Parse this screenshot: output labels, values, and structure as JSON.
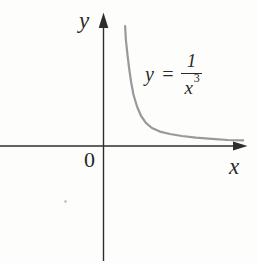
{
  "figure": {
    "background_color": "#fdfdfb",
    "axis_color": "#2e2e2e",
    "text_color": "#2a2a2a",
    "curve_color": "#98999b",
    "labels": {
      "y_axis": "y",
      "x_axis": "x",
      "origin": "0"
    },
    "equation": {
      "lhs": "y",
      "equals": "=",
      "numerator": "1",
      "denominator_base": "x",
      "denominator_exponent": "3"
    }
  },
  "chart_data": {
    "type": "line",
    "title": "",
    "equation": "y = 1/x^3",
    "xlabel": "x",
    "ylabel": "y",
    "origin_label": "0",
    "x": [
      0.54,
      0.56,
      0.6,
      0.64,
      0.69,
      0.75,
      0.84,
      0.94,
      1.06,
      1.21,
      1.41,
      1.66,
      1.96,
      2.31,
      2.71,
      3.11,
      3.49
    ],
    "y": [
      3.0,
      2.65,
      2.28,
      1.95,
      1.6,
      1.28,
      0.98,
      0.75,
      0.58,
      0.45,
      0.36,
      0.3,
      0.25,
      0.21,
      0.18,
      0.15,
      0.14
    ],
    "xlim": [
      -2.59,
      3.86
    ],
    "ylim": [
      -2.93,
      3.65
    ],
    "grid": false,
    "legend": "none"
  }
}
